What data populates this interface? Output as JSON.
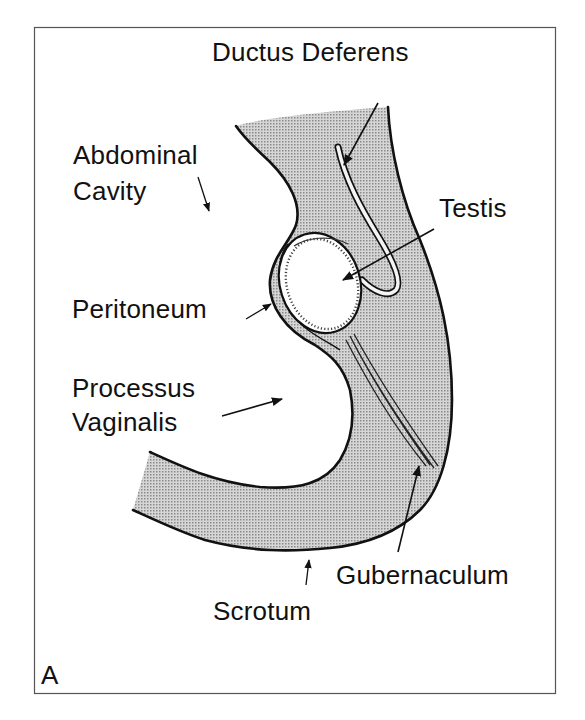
{
  "figure": {
    "panel_letter": "A",
    "colors": {
      "ink": "#111111",
      "shading": "#b9b9b9",
      "background": "#ffffff",
      "frame": "#555555"
    }
  },
  "labels": {
    "ductus_deferens": "Ductus Deferens",
    "abdominal_line1": "Abdominal",
    "abdominal_line2": "Cavity",
    "testis": "Testis",
    "peritoneum": "Peritoneum",
    "processus_line1": "Processus",
    "processus_line2": "Vaginalis",
    "gubernaculum": "Gubernaculum",
    "scrotum": "Scrotum"
  }
}
